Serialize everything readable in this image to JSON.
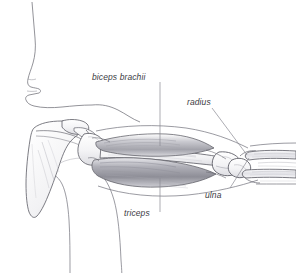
{
  "figure": {
    "background_color": "#ffffff",
    "line_color": "#4a4a50",
    "label_color": "#3b3b3f",
    "shading_color": "#8d8d94"
  },
  "labels": {
    "biceps": "biceps brachii",
    "radius": "radius",
    "ulna": "ulna",
    "triceps": "triceps"
  },
  "structures": [
    {
      "name": "facial-profile",
      "label": ""
    },
    {
      "name": "scapula",
      "label": ""
    },
    {
      "name": "humerus",
      "label": ""
    },
    {
      "name": "biceps-brachii",
      "label": "biceps brachii"
    },
    {
      "name": "triceps-brachii",
      "label": "triceps"
    },
    {
      "name": "radius-bone",
      "label": "radius"
    },
    {
      "name": "ulna-bone",
      "label": "ulna"
    },
    {
      "name": "torso-outline",
      "label": ""
    },
    {
      "name": "forearm-outline",
      "label": ""
    }
  ],
  "leader_lines": [
    {
      "name": "biceps-leader",
      "from": "biceps brachii",
      "orientation": "vertical-down"
    },
    {
      "name": "triceps-leader",
      "from": "triceps",
      "orientation": "vertical-up"
    },
    {
      "name": "radius-leader",
      "from": "radius",
      "orientation": "diagonal-down-right"
    },
    {
      "name": "ulna-leader",
      "from": "ulna",
      "orientation": "diagonal-up-right"
    }
  ]
}
